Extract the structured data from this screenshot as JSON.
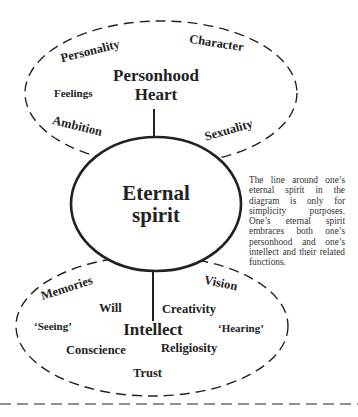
{
  "diagram": {
    "personhood_region": {
      "title_line1": "Personhood",
      "title_line2": "Heart",
      "items": {
        "personality": "Personality",
        "character": "Character",
        "feelings": "Feelings",
        "ambition": "Ambition",
        "sexuality": "Sexuality"
      }
    },
    "spirit_region": {
      "title_line1": "Eternal",
      "title_line2": "spirit"
    },
    "intellect_region": {
      "title": "Intellect",
      "items": {
        "memories": "Memories",
        "vision": "Vision",
        "will": "Will",
        "creativity": "Creativity",
        "seeing": "‘Seeing’",
        "hearing": "‘Hearing’",
        "conscience": "Conscience",
        "religiosity": "Religiosity",
        "trust": "Trust"
      }
    },
    "note": "The line around one’s eternal spirit in the diagram is only for simplicity purposes. One’s eternal spirit embraces both one’s personhood and one’s intellect and their related functions.",
    "colors": {
      "stroke": "#222222",
      "text": "#222222",
      "background": "#ffffff"
    }
  }
}
